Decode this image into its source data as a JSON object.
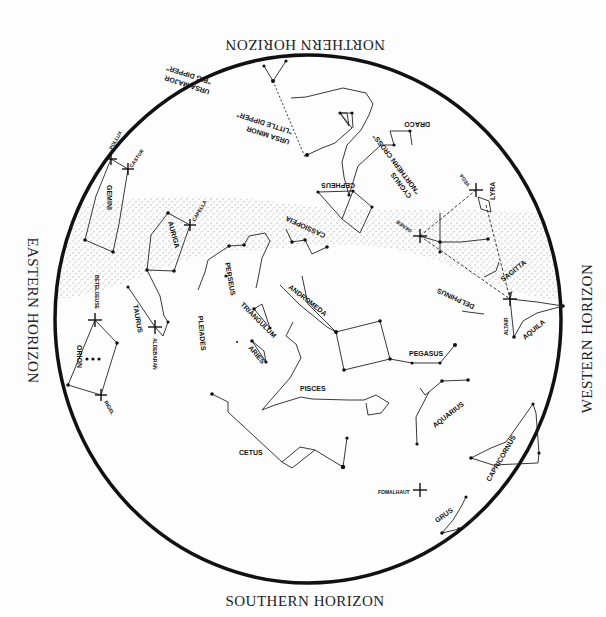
{
  "horizons": {
    "north": "NORTHERN HORIZON",
    "south": "SOUTHERN HORIZON",
    "east": "EASTERN HORIZON",
    "west": "WESTERN HORIZON"
  },
  "constellations": {
    "ursa_major": "URSA MAJOR",
    "big_dipper": "\"BIG DIPPER\"",
    "ursa_minor": "URSA MINOR",
    "little_dipper": "\"LITTLE DIPPER\"",
    "polaris": "POLARIS \"NORTH STAR\"",
    "draco": "DRACO",
    "cepheus": "CEPHEUS",
    "cassiopeia": "CASSIOPEIA",
    "cygnus": "CYGNUS",
    "northern_cross": "\"NORTHERN CROSS\"",
    "lyra": "LYRA",
    "gemini": "GEMINI",
    "auriga": "AURIGA",
    "perseus": "PERSEUS",
    "andromeda": "ANDROMEDA",
    "triangulum": "TRIANGULUM",
    "aries": "ARIES",
    "taurus": "TAURUS",
    "pleiades": "PLEIADES",
    "orion": "ORION",
    "sagitta": "SAGITTA",
    "delphinus": "DELPHINUS",
    "aquila": "AQUILA",
    "pegasus": "PEGASUS",
    "pisces": "PISCES",
    "aquarius": "AQUARIUS",
    "capricornus": "CAPRICORNUS",
    "cetus": "CETUS",
    "grus": "GRUS"
  },
  "stars": {
    "pollux": "POLLUX",
    "castor": "CASTOR",
    "capella": "CAPELLA",
    "betelgeuse": "BETELGEUSE",
    "aldebaran": "ALDEBARAN",
    "rigel": "RIGEL",
    "vega": "VEGA",
    "deneb": "DENEB",
    "altair": "ALTAIR",
    "fomalhaut": "FOMALHAUT"
  },
  "colors": {
    "ink": "#111111",
    "background": "#fdfdfd",
    "milky_way": "#9a9a9a"
  }
}
